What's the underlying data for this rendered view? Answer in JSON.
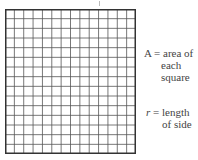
{
  "diagram": {
    "grid": {
      "columns": 14,
      "rows": 15,
      "line_color": "#555555",
      "border_color": "#333333"
    },
    "labels": {
      "area": {
        "symbol": "A",
        "equals": "=",
        "line1": "area of",
        "line2": "each",
        "line3": "square"
      },
      "length": {
        "symbol": "r",
        "equals": "=",
        "line1": "length",
        "line2": "of side"
      }
    }
  }
}
